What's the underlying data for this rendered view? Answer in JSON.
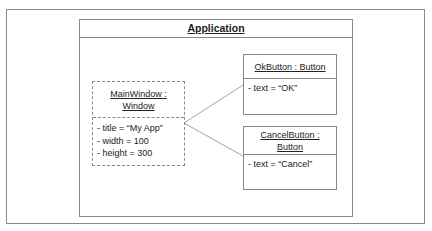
{
  "diagram": {
    "type": "UML object diagram",
    "container": {
      "title": "Application"
    },
    "objects": [
      {
        "id": "main-window",
        "name": "MainWindow : Window",
        "name_lines": [
          "MainWindow :",
          "Window"
        ],
        "border": "dashed",
        "attributes": [
          "- title = “My App”",
          "- width = 100",
          "- height = 300"
        ]
      },
      {
        "id": "ok-button",
        "name": "OkButton : Button",
        "name_lines": [
          "OkButton : Button"
        ],
        "border": "solid",
        "attributes": [
          "- text = “OK”"
        ]
      },
      {
        "id": "cancel-button",
        "name": "CancelButton : Button",
        "name_lines": [
          "CancelButton :",
          "Button"
        ],
        "border": "solid",
        "attributes": [
          "- text = “Cancel”"
        ]
      }
    ],
    "links": [
      {
        "from": "main-window",
        "to": "ok-button"
      },
      {
        "from": "main-window",
        "to": "cancel-button"
      }
    ],
    "colors": {
      "line": "#8a8a8a",
      "text": "#222222",
      "background": "#ffffff"
    }
  }
}
